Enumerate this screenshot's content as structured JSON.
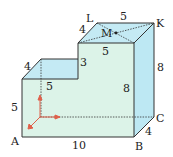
{
  "diagram": {
    "type": "3d-solid-L-shape",
    "colors": {
      "front_face": "#dcf3e8",
      "top_face": "#c4eaf4",
      "side_face": "#bde8f3",
      "edge": "#333333",
      "axis_arrow": "#e0604a"
    },
    "vertices": {
      "A": "A",
      "B": "B",
      "C": "C",
      "K": "K",
      "L": "L",
      "M": "M"
    },
    "dimensions": {
      "AB": "10",
      "BC": "4",
      "right_height": "8",
      "inner_height": "8",
      "LK": "5",
      "L_edge_depth": "4",
      "top_front_width": "5",
      "step_height": "3",
      "left_depth": "4",
      "left_top_width": "5",
      "left_height": "5"
    }
  }
}
